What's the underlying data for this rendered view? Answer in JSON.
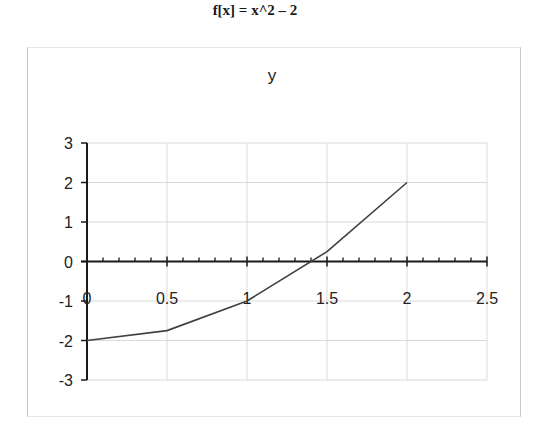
{
  "page": {
    "title": "f[x] = x^2 – 2"
  },
  "chart_data": {
    "type": "line",
    "title": "y",
    "function_label": "f[x] = x^2 – 2",
    "xlabel": "",
    "ylabel": "",
    "x": [
      0,
      0.5,
      1,
      1.5,
      2
    ],
    "series": [
      {
        "name": "y",
        "values": [
          -2,
          -1.75,
          -1,
          0.25,
          2
        ],
        "color": "#404040"
      }
    ],
    "xlim": [
      0,
      2.5
    ],
    "ylim": [
      -3,
      3
    ],
    "x_ticks": [
      "0",
      "0.5",
      "1",
      "1.5",
      "2",
      "2.5"
    ],
    "y_ticks": [
      "3",
      "2",
      "1",
      "0",
      "-1",
      "-2",
      "-3"
    ],
    "x_minor_tick_step": 0.1,
    "grid": true,
    "legend": "none",
    "colors": {
      "line": "#404040",
      "grid": "#d9d9d9",
      "axis": "#1a1a1a",
      "frame": "#c8c8c8"
    }
  }
}
